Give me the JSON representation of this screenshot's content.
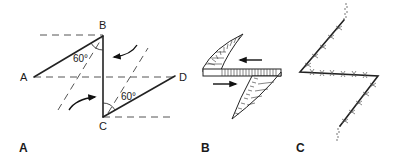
{
  "figure": {
    "panels": [
      {
        "id": "A",
        "label": "A",
        "points": {
          "A": {
            "label": "A",
            "x": 34,
            "y": 77
          },
          "B": {
            "label": "B",
            "x": 103,
            "y": 36
          },
          "C": {
            "label": "C",
            "x": 103,
            "y": 117
          },
          "D": {
            "label": "D",
            "x": 175,
            "y": 76
          }
        },
        "angles": [
          {
            "vertex": "B",
            "label": "60°"
          },
          {
            "vertex": "C",
            "label": "60°"
          }
        ]
      },
      {
        "id": "B",
        "label": "B"
      },
      {
        "id": "C",
        "label": "C"
      }
    ],
    "colors": {
      "line": "#222222",
      "dash": "#555555",
      "background": "#ffffff"
    }
  }
}
